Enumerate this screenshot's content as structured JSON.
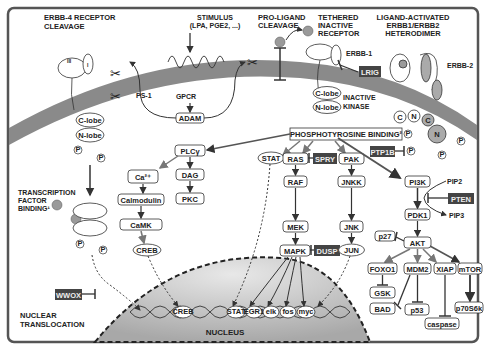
{
  "diagram": {
    "title_labels": {
      "erbb4_cleavage": [
        "ERBB-4 RECEPTOR",
        "CLEAVAGE"
      ],
      "stimulus": [
        "STIMULUS",
        "(LPA, PGE2, ...)"
      ],
      "proligand": [
        "PRO-LIGAND",
        "CLEAVAGE"
      ],
      "tethered": [
        "TETHERED",
        "INACTIVE",
        "RECEPTOR"
      ],
      "ligand_activated": [
        "LIGAND-ACTIVATED",
        "ERBB1/ERBB2",
        "HETERODIMER"
      ],
      "transcription_factor": [
        "TRANSCRIPTION",
        "FACTOR",
        "BINDING¹"
      ],
      "nuclear_translocation": [
        "NUCLEAR",
        "TRANSLOCATION"
      ],
      "nucleus": "NUCLEUS",
      "inactive_kinase": [
        "INACTIVE",
        "KINASE"
      ]
    },
    "receptor_labels": {
      "erbb1": "ERBB-1",
      "erbb2": "ERBB-2",
      "ps1": "PS-1",
      "gpcr": "GPCR",
      "c_lobe": "C-lobe",
      "n_lobe": "N-lobe",
      "domain_I": "I",
      "domain_II": "II",
      "domain_III": "III",
      "domain_IV": "IV",
      "c": "C",
      "n": "N",
      "p": "P"
    },
    "phosphotyrosine": "PHOSPHOTYROSINE BINDING²",
    "nodes": {
      "adam": "ADAM",
      "plcg": "PLCγ",
      "ca": "Ca²⁺",
      "dag": "DAG",
      "pkc": "PKC",
      "calmodulin": "Calmodulin",
      "camk": "CaMK",
      "creb": "CREB",
      "stat": "STAT",
      "ras": "RAS",
      "raf": "RAF",
      "mek": "MEK",
      "mapk": "MAPK",
      "pak": "PAK",
      "jnkk": "JNKK",
      "jnk": "JNK",
      "jun": "JUN",
      "pi3k": "PI3K",
      "pip2": "PIP2",
      "pip3": "PIP3",
      "pdk1": "PDK1",
      "akt": "AKT",
      "p27": "p27",
      "foxo1": "FOXO1",
      "mdm2": "MDM2",
      "xiap": "XIAP",
      "mtor": "mTOR",
      "gsk": "GSK",
      "bad": "BAD",
      "p53": "p53",
      "caspase": "caspase",
      "p70s6k": "p70S6k"
    },
    "inhibitors": {
      "lrig": "LRIG",
      "ptp1b": "PTP1B",
      "spry": "SPRY",
      "pten": "PTEN",
      "dusp": "DUSP",
      "wwox": "WWOX"
    },
    "dna_factors": [
      "CREB",
      "STAT",
      "EGR1",
      "elk",
      "fos",
      "myc"
    ],
    "colors": {
      "membrane": "#8a8a8a",
      "inhibitor_box": "#444444",
      "ligand": "#9a9a9a",
      "nucleus_fill": "#c8c8c8",
      "frame": "#555555"
    }
  }
}
